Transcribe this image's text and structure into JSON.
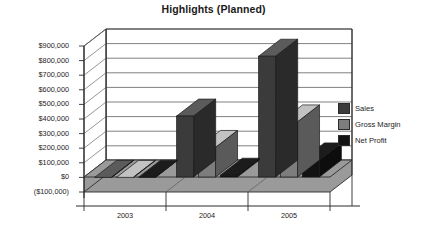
{
  "chart_data": {
    "type": "bar",
    "title": "Highlights (Planned)",
    "xlabel": "",
    "ylabel": "",
    "categories": [
      "2003",
      "2004",
      "2005"
    ],
    "series": [
      {
        "name": "Sales",
        "values": [
          0,
          420000,
          830000
        ],
        "color": "#3b3b3b"
      },
      {
        "name": "Gross Margin",
        "values": [
          0,
          205000,
          380000
        ],
        "color": "#7d7d7d"
      },
      {
        "name": "Net Profit",
        "values": [
          0,
          15000,
          120000
        ],
        "color": "#121212"
      }
    ],
    "ylim": [
      -100000,
      900000
    ],
    "ytick_labels": [
      "$900,000",
      "$800,000",
      "$700,000",
      "$600,000",
      "$500,000",
      "$400,000",
      "$300,000",
      "$200,000",
      "$100,000",
      "$0",
      "($100,000)"
    ],
    "ytick_values": [
      900000,
      800000,
      700000,
      600000,
      500000,
      400000,
      300000,
      200000,
      100000,
      0,
      -100000
    ],
    "grid": true,
    "legend_position": "right",
    "three_d": true,
    "plot_bgcolor": "#ffffff",
    "floor_color": "#9a9a9a",
    "axis_color": "#2b2b2b"
  },
  "legend": {
    "items": [
      {
        "label": "Sales"
      },
      {
        "label": "Gross Margin"
      },
      {
        "label": "Net Profit"
      }
    ]
  }
}
